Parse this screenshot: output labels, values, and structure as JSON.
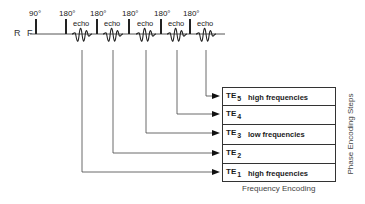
{
  "rf_label": "R F",
  "pulses": [
    {
      "angle": "90°",
      "x": 36
    },
    {
      "angle": "180°",
      "x": 66
    },
    {
      "angle": "180°",
      "x": 97
    },
    {
      "angle": "180°",
      "x": 129
    },
    {
      "angle": "180°",
      "x": 161
    },
    {
      "angle": "180°",
      "x": 190
    }
  ],
  "echoes": [
    {
      "label": "echo",
      "x": 82
    },
    {
      "label": "echo",
      "x": 113
    },
    {
      "label": "echo",
      "x": 146
    },
    {
      "label": "echo",
      "x": 177
    },
    {
      "label": "echo",
      "x": 206
    }
  ],
  "kspace_rows": [
    {
      "te": "TE",
      "index": "5",
      "desc": "high frequencies"
    },
    {
      "te": "TE",
      "index": "4",
      "desc": ""
    },
    {
      "te": "TE",
      "index": "3",
      "desc": "low frequencies"
    },
    {
      "te": "TE",
      "index": "2",
      "desc": ""
    },
    {
      "te": "TE",
      "index": "1",
      "desc": "high frequencies"
    }
  ],
  "axis_labels": {
    "frequency": "Frequency Encoding",
    "phase": "Phase Encoding Steps"
  },
  "colors": {
    "line": "#333333",
    "baseline": "#555555"
  }
}
